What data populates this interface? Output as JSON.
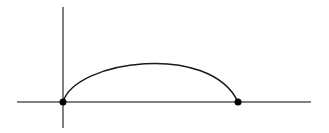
{
  "diagram": {
    "colors": {
      "axis": "#555555",
      "curve": "#1a1a1a",
      "point": "#000000",
      "background": "#ffffff"
    },
    "elements": [
      "x-axis",
      "y-axis",
      "arc",
      "start-point",
      "end-point"
    ],
    "labels": []
  }
}
